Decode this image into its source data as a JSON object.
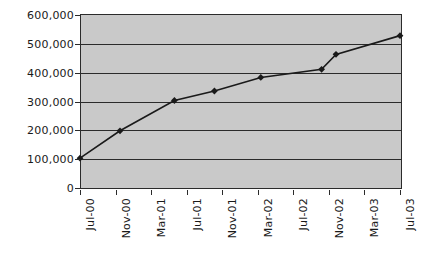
{
  "chart_data": {
    "type": "line",
    "title": "",
    "subtitle": "",
    "xlabel": "",
    "ylabel": "",
    "grid": true,
    "legend": false,
    "legend_position": "none",
    "plot_background_color": "#c9c9c9",
    "page_background_color": "#ffffff",
    "series_color": "#1a1a1a",
    "marker": "diamond",
    "ylim": [
      0,
      600000
    ],
    "ytick_labels": [
      "600,000",
      "500,000",
      "400,000",
      "300,000",
      "200,000",
      "100,000",
      "0"
    ],
    "ytick_values": [
      600000,
      500000,
      400000,
      300000,
      200000,
      100000,
      0
    ],
    "xtick_labels": [
      "Jul-00",
      "Nov-00",
      "Mar-01",
      "Jul-01",
      "Nov-01",
      "Mar-02",
      "Jul-02",
      "Nov-02",
      "Mar-03",
      "Jul-03"
    ],
    "series": [
      {
        "name": "",
        "points": [
          {
            "x": "Jul-00",
            "y": 100000
          },
          {
            "x": "Nov-00",
            "y": 195000
          },
          {
            "x": "Mar-01",
            "y": 300000
          },
          {
            "x": "Jul-01",
            "y": 333000
          },
          {
            "x": "Nov-01",
            "y": 380000
          },
          {
            "x": "Nov-02",
            "y": 408000
          },
          {
            "x": "Mar-03",
            "y": 460000
          },
          {
            "x": "Jul-03",
            "y": 525000
          }
        ],
        "x_fractions": [
          0.0,
          0.125,
          0.295,
          0.42,
          0.565,
          0.755,
          0.8,
          1.0
        ],
        "values": [
          100000,
          195000,
          300000,
          333000,
          380000,
          408000,
          460000,
          525000
        ]
      }
    ]
  }
}
